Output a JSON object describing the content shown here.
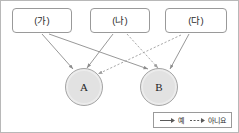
{
  "diagram": {
    "title": "",
    "boxes": [
      {
        "id": "ga",
        "label": "(가)"
      },
      {
        "id": "na",
        "label": "(나)"
      },
      {
        "id": "da",
        "label": "(다)"
      }
    ],
    "circles": [
      {
        "id": "a",
        "label": "A"
      },
      {
        "id": "b",
        "label": "B"
      }
    ],
    "edges": [
      {
        "from": "ga",
        "to": "a",
        "style": "solid",
        "meaning": "예"
      },
      {
        "from": "ga",
        "to": "b",
        "style": "solid",
        "meaning": "예"
      },
      {
        "from": "na",
        "to": "a",
        "style": "solid",
        "meaning": "예"
      },
      {
        "from": "na",
        "to": "b",
        "style": "dashed",
        "meaning": "아니요"
      },
      {
        "from": "da",
        "to": "a",
        "style": "dashed",
        "meaning": "아니요"
      },
      {
        "from": "da",
        "to": "b",
        "style": "solid",
        "meaning": "예"
      }
    ],
    "colors": {
      "line": "#8c8c8c",
      "box_border": "#9a9a9a",
      "circle_fill": "#e2e2e2",
      "circle_border": "#a5a5a5",
      "frame": "#b8b8b8",
      "text": "#2b2b2b"
    }
  },
  "legend": {
    "entries": [
      {
        "id": "yes",
        "label": "예",
        "style": "solid"
      },
      {
        "id": "no",
        "label": "아니요",
        "style": "dashed"
      }
    ]
  }
}
